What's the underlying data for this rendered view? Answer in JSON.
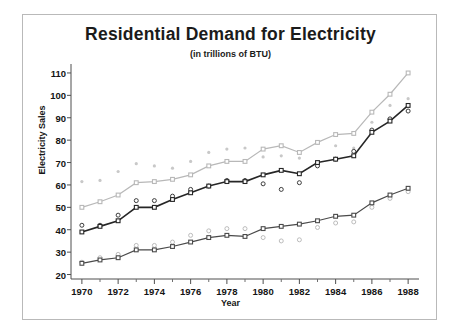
{
  "chart_data": {
    "type": "line",
    "title": "Residential Demand for Electricity",
    "subtitle": "(in trillions of BTU)",
    "xlabel": "Year",
    "ylabel": "Electricity Sales",
    "xlim": [
      1969.4,
      1988.6
    ],
    "ylim": [
      18,
      114
    ],
    "yticks": [
      20,
      30,
      40,
      50,
      60,
      70,
      80,
      90,
      100,
      110
    ],
    "xticks": [
      1970,
      1972,
      1974,
      1976,
      1978,
      1980,
      1982,
      1984,
      1986,
      1988
    ],
    "xminorticks": [
      1971,
      1973,
      1975,
      1977,
      1979,
      1981,
      1983,
      1985,
      1987
    ],
    "grid": false,
    "legend": "none",
    "x": [
      1970,
      1971,
      1972,
      1973,
      1974,
      1975,
      1976,
      1977,
      1978,
      1979,
      1980,
      1981,
      1982,
      1983,
      1984,
      1985,
      1986,
      1987,
      1988
    ],
    "series": [
      {
        "name": "upper",
        "color": "#b8b8b8",
        "marker": "square",
        "values": [
          50.0,
          52.5,
          55.5,
          61.0,
          61.5,
          62.5,
          64.5,
          68.5,
          70.5,
          70.5,
          76.0,
          77.5,
          74.5,
          79.0,
          82.5,
          83.0,
          92.5,
          100.5,
          110.0
        ]
      },
      {
        "name": "middle",
        "color": "#262626",
        "marker": "square",
        "values": [
          39.0,
          41.5,
          44.0,
          50.0,
          50.0,
          53.5,
          56.5,
          59.5,
          61.5,
          61.5,
          64.5,
          66.5,
          65.0,
          70.0,
          71.5,
          73.0,
          83.5,
          88.5,
          95.5
        ]
      },
      {
        "name": "lower",
        "color": "#4a4a4a",
        "marker": "square",
        "values": [
          25.0,
          26.5,
          27.5,
          31.0,
          31.0,
          32.5,
          34.5,
          36.5,
          37.5,
          37.0,
          40.5,
          41.5,
          42.5,
          44.0,
          46.0,
          46.5,
          52.0,
          55.5,
          58.5
        ]
      }
    ],
    "scatter": [
      {
        "name": "upper-scatter",
        "color": "#c8c8c8",
        "marker": "dot",
        "points": [
          [
            1970,
            61.5
          ],
          [
            1971,
            62.0
          ],
          [
            1972,
            66.0
          ],
          [
            1973,
            69.5
          ],
          [
            1974,
            68.5
          ],
          [
            1975,
            67.5
          ],
          [
            1976,
            70.5
          ],
          [
            1977,
            74.5
          ],
          [
            1978,
            76.0
          ],
          [
            1979,
            76.5
          ],
          [
            1980,
            72.5
          ],
          [
            1981,
            73.0
          ],
          [
            1982,
            72.0
          ],
          [
            1983,
            78.5
          ],
          [
            1984,
            77.5
          ],
          [
            1985,
            76.5
          ],
          [
            1986,
            88.0
          ],
          [
            1987,
            95.5
          ],
          [
            1988,
            98.5
          ]
        ]
      },
      {
        "name": "middle-scatter",
        "color": "#3c3c3c",
        "marker": "circle",
        "points": [
          [
            1970,
            42.0
          ],
          [
            1971,
            42.0
          ],
          [
            1972,
            46.5
          ],
          [
            1973,
            53.0
          ],
          [
            1974,
            53.0
          ],
          [
            1975,
            55.0
          ],
          [
            1976,
            58.0
          ],
          [
            1977,
            59.5
          ],
          [
            1978,
            62.0
          ],
          [
            1979,
            62.0
          ],
          [
            1980,
            60.5
          ],
          [
            1981,
            58.0
          ],
          [
            1982,
            61.0
          ],
          [
            1983,
            68.5
          ],
          [
            1984,
            71.5
          ],
          [
            1985,
            75.0
          ],
          [
            1986,
            84.5
          ],
          [
            1987,
            89.5
          ],
          [
            1988,
            93.0
          ]
        ]
      },
      {
        "name": "lower-scatter",
        "color": "#bcbcbc",
        "marker": "circle",
        "points": [
          [
            1970,
            25.5
          ],
          [
            1971,
            27.5
          ],
          [
            1972,
            29.0
          ],
          [
            1973,
            33.0
          ],
          [
            1974,
            33.0
          ],
          [
            1975,
            34.5
          ],
          [
            1976,
            37.5
          ],
          [
            1977,
            39.5
          ],
          [
            1978,
            40.5
          ],
          [
            1979,
            40.5
          ],
          [
            1980,
            36.5
          ],
          [
            1981,
            35.0
          ],
          [
            1982,
            35.5
          ],
          [
            1983,
            41.0
          ],
          [
            1984,
            43.0
          ],
          [
            1985,
            43.5
          ],
          [
            1986,
            50.0
          ],
          [
            1987,
            54.0
          ],
          [
            1988,
            57.0
          ]
        ]
      }
    ]
  }
}
